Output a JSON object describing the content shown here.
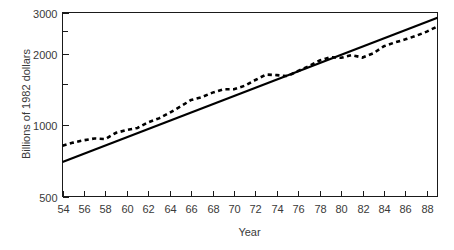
{
  "chart_data": {
    "type": "line",
    "title": "",
    "xlabel": "Year",
    "ylabel": "Billions of 1982 dollars",
    "xlim": [
      54,
      89
    ],
    "ylim": [
      500,
      3000
    ],
    "yscale": "log",
    "grid": false,
    "legend": "none",
    "x_ticks": [
      54,
      56,
      58,
      60,
      62,
      64,
      66,
      68,
      70,
      72,
      74,
      76,
      78,
      80,
      82,
      84,
      86,
      88
    ],
    "x_tick_labels": [
      "54",
      "56",
      "58",
      "60",
      "62",
      "64",
      "66",
      "68",
      "70",
      "72",
      "74",
      "76",
      "78",
      "80",
      "82",
      "84",
      "86",
      "88"
    ],
    "y_ticks": [
      500,
      1000,
      1500,
      2000,
      2500,
      3000
    ],
    "y_tick_labels": [
      "500",
      "1000",
      "",
      "2000",
      "",
      "3000"
    ],
    "y_labeled_ticks": [
      500,
      1000,
      2000,
      3000
    ],
    "series": [
      {
        "name": "Actual",
        "style": "dashed",
        "x": [
          54,
          55,
          56,
          57,
          58,
          59,
          60,
          61,
          62,
          63,
          64,
          65,
          66,
          67,
          68,
          69,
          70,
          71,
          72,
          73,
          74,
          75,
          76,
          77,
          78,
          79,
          80,
          81,
          82,
          83,
          84,
          85,
          86,
          87,
          88,
          89
        ],
        "values": [
          820,
          845,
          865,
          880,
          875,
          930,
          955,
          975,
          1030,
          1070,
          1130,
          1200,
          1280,
          1315,
          1375,
          1420,
          1420,
          1470,
          1555,
          1640,
          1630,
          1615,
          1700,
          1780,
          1880,
          1940,
          1930,
          1980,
          1935,
          2015,
          2160,
          2240,
          2310,
          2390,
          2490,
          2620
        ]
      },
      {
        "name": "Exponential trend",
        "style": "solid",
        "x": [
          54,
          89
        ],
        "values": [
          700,
          2850
        ]
      }
    ]
  }
}
